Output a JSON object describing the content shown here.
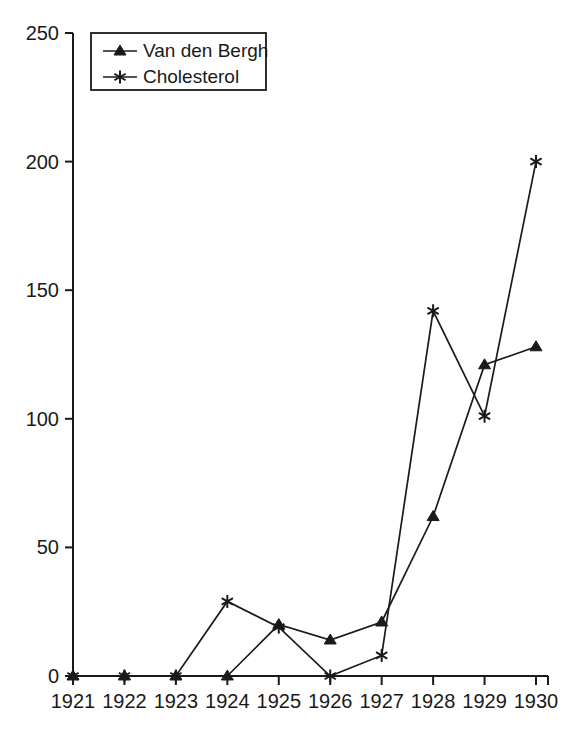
{
  "chart_data": {
    "type": "line",
    "title": "",
    "subtitle": "",
    "xlabel": "",
    "ylabel": "",
    "categories": [
      "1921",
      "1922",
      "1923",
      "1924",
      "1925",
      "1926",
      "1927",
      "1928",
      "1929",
      "1930"
    ],
    "x": [
      1921,
      1922,
      1923,
      1924,
      1925,
      1926,
      1927,
      1928,
      1929,
      1930
    ],
    "xlim": [
      1921,
      1930
    ],
    "ylim": [
      0,
      250
    ],
    "yticks": [
      0,
      50,
      100,
      150,
      200,
      250
    ],
    "ytick_labels": [
      "0",
      "50",
      "100",
      "150",
      "200",
      "250"
    ],
    "xtick_labels": [
      "1921",
      "1922",
      "1923",
      "1924",
      "1925",
      "1926",
      "1927",
      "1928",
      "1929",
      "1930"
    ],
    "grid": false,
    "legend_position": "top-left",
    "series": [
      {
        "name": "Van den Bergh",
        "marker": "triangle",
        "color": "#1a1a1a",
        "values": [
          0,
          0,
          0,
          0,
          20,
          14,
          21,
          62,
          121,
          128
        ]
      },
      {
        "name": "Cholesterol",
        "marker": "asterisk",
        "color": "#1a1a1a",
        "values": [
          0,
          0,
          0,
          29,
          19,
          0,
          8,
          142,
          101,
          200
        ]
      }
    ]
  },
  "legend": {
    "entries": [
      {
        "label": "Van den Bergh",
        "marker": "triangle-marker-icon"
      },
      {
        "label": "Cholesterol",
        "marker": "asterisk-marker-icon"
      }
    ]
  },
  "axes": {
    "y_ticks": [
      "0",
      "50",
      "100",
      "150",
      "200",
      "250"
    ],
    "x_ticks": [
      "1921",
      "1922",
      "1923",
      "1924",
      "1925",
      "1926",
      "1927",
      "1928",
      "1929",
      "1930"
    ]
  },
  "colors": {
    "ink": "#1a1a1a",
    "background": "#ffffff"
  }
}
